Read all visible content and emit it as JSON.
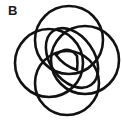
{
  "panel": {
    "label": "B",
    "stroke_color": "#111111",
    "background": "#ffffff"
  },
  "diagram": {
    "shapes": [
      {
        "name": "top-circle",
        "cx": 69,
        "cy": 40,
        "r": 34
      },
      {
        "name": "left-circle",
        "cx": 49,
        "cy": 63,
        "r": 34
      },
      {
        "name": "right-circle",
        "cx": 85,
        "cy": 60,
        "r": 34
      },
      {
        "name": "bottom-circle",
        "cx": 67,
        "cy": 83,
        "r": 32
      },
      {
        "name": "inner-ellipse",
        "cx": 75,
        "cy": 58,
        "rx": 24,
        "ry": 34,
        "rotate": -32
      },
      {
        "name": "inner-lens"
      }
    ]
  }
}
